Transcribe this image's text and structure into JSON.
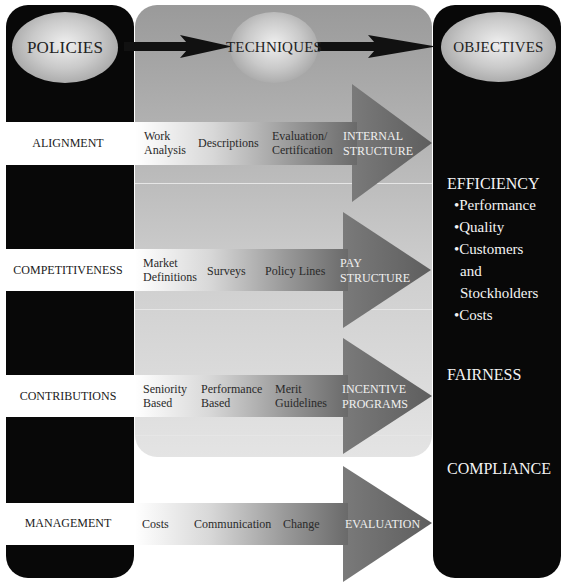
{
  "headers": {
    "policies": "POLICIES",
    "techniques": "TECHNIQUES",
    "objectives": "OBJECTIVES"
  },
  "rows": [
    {
      "policy": "ALIGNMENT",
      "techniques": [
        {
          "line1": "Work",
          "line2": "Analysis"
        },
        {
          "line1": "Descriptions",
          "line2": ""
        },
        {
          "line1": "Evaluation/",
          "line2": "Certification"
        }
      ],
      "outcome": {
        "line1": "INTERNAL",
        "line2": "STRUCTURE"
      }
    },
    {
      "policy": "COMPETITIVENESS",
      "techniques": [
        {
          "line1": "Market",
          "line2": "Definitions"
        },
        {
          "line1": "Surveys",
          "line2": ""
        },
        {
          "line1": "Policy Lines",
          "line2": ""
        }
      ],
      "outcome": {
        "line1": "PAY",
        "line2": "STRUCTURE"
      }
    },
    {
      "policy": "CONTRIBUTIONS",
      "techniques": [
        {
          "line1": "Seniority",
          "line2": "Based"
        },
        {
          "line1": "Performance",
          "line2": "Based"
        },
        {
          "line1": "Merit",
          "line2": "Guidelines"
        }
      ],
      "outcome": {
        "line1": "INCENTIVE",
        "line2": "PROGRAMS"
      }
    },
    {
      "policy": "MANAGEMENT",
      "techniques": [
        {
          "line1": "Costs",
          "line2": ""
        },
        {
          "line1": "Communication",
          "line2": ""
        },
        {
          "line1": "Change",
          "line2": ""
        }
      ],
      "outcome": {
        "line1": "EVALUATION",
        "line2": ""
      }
    }
  ],
  "objectives": {
    "efficiency": {
      "title": "EFFICIENCY",
      "items": [
        "•Performance",
        "•Quality",
        "•Customers",
        "and",
        "Stockholders",
        "•Costs"
      ]
    },
    "fairness": "FAIRNESS",
    "compliance": "COMPLIANCE"
  },
  "colors": {
    "panel_black": "#080808",
    "arrow_gray": "#6e6e6e",
    "band_white": "#ffffff"
  }
}
